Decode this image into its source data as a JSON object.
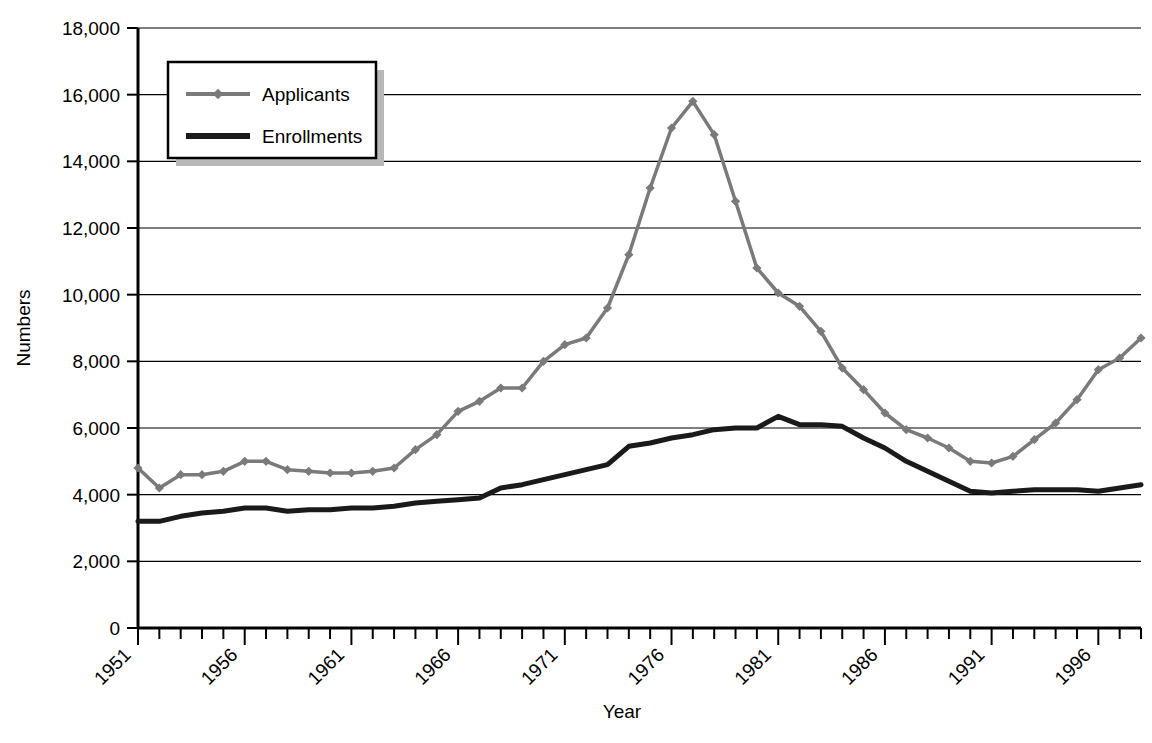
{
  "chart_data": {
    "type": "line",
    "title": "",
    "xlabel": "Year",
    "ylabel": "Numbers",
    "xlim": [
      1951,
      1998
    ],
    "ylim": [
      0,
      18000
    ],
    "ytick_labels": [
      "0",
      "2,000",
      "4,000",
      "6,000",
      "8,000",
      "10,000",
      "12,000",
      "14,000",
      "16,000",
      "18,000"
    ],
    "ytick_values": [
      0,
      2000,
      4000,
      6000,
      8000,
      10000,
      12000,
      14000,
      16000,
      18000
    ],
    "xtick_labels": [
      "1951",
      "1956",
      "1961",
      "1966",
      "1971",
      "1976",
      "1981",
      "1986",
      "1991",
      "1996"
    ],
    "xtick_values": [
      1951,
      1956,
      1961,
      1966,
      1971,
      1976,
      1981,
      1986,
      1991,
      1996
    ],
    "grid": "horizontal",
    "legend_position": "upper-left",
    "x": [
      1951,
      1952,
      1953,
      1954,
      1955,
      1956,
      1957,
      1958,
      1959,
      1960,
      1961,
      1962,
      1963,
      1964,
      1965,
      1966,
      1967,
      1968,
      1969,
      1970,
      1971,
      1972,
      1973,
      1974,
      1975,
      1976,
      1977,
      1978,
      1979,
      1980,
      1981,
      1982,
      1983,
      1984,
      1985,
      1986,
      1987,
      1988,
      1989,
      1990,
      1991,
      1992,
      1993,
      1994,
      1995,
      1996,
      1997,
      1998
    ],
    "series": [
      {
        "name": "Applicants",
        "color": "#7a7a7a",
        "marker": "diamond",
        "line_width": 3.5,
        "values": [
          4800,
          4200,
          4600,
          4600,
          4700,
          5000,
          5000,
          4750,
          4700,
          4650,
          4650,
          4700,
          4800,
          5350,
          5800,
          6500,
          6800,
          7200,
          7200,
          8000,
          8500,
          8700,
          9600,
          11200,
          13200,
          15000,
          15800,
          14800,
          12800,
          10800,
          10050,
          9650,
          8900,
          7800,
          7150,
          6450,
          5950,
          5700,
          5400,
          5000,
          4950,
          5150,
          5650,
          6150,
          6850,
          7750,
          8100,
          8700
        ]
      },
      {
        "name": "Enrollments",
        "color": "#1a1a1a",
        "marker": "none",
        "line_width": 5,
        "values": [
          3200,
          3200,
          3350,
          3450,
          3500,
          3600,
          3600,
          3500,
          3550,
          3550,
          3600,
          3600,
          3650,
          3750,
          3800,
          3850,
          3900,
          4200,
          4300,
          4450,
          4600,
          4750,
          4900,
          5450,
          5550,
          5700,
          5800,
          5950,
          6000,
          6000,
          6350,
          6100,
          6100,
          6050,
          5700,
          5400,
          5000,
          4700,
          4400,
          4100,
          4050,
          4100,
          4150,
          4150,
          4150,
          4100,
          4200,
          4300
        ]
      }
    ],
    "legend": [
      {
        "label": "Applicants",
        "color": "#7a7a7a",
        "marker": "diamond"
      },
      {
        "label": "Enrollments",
        "color": "#1a1a1a",
        "marker": "none"
      }
    ]
  }
}
